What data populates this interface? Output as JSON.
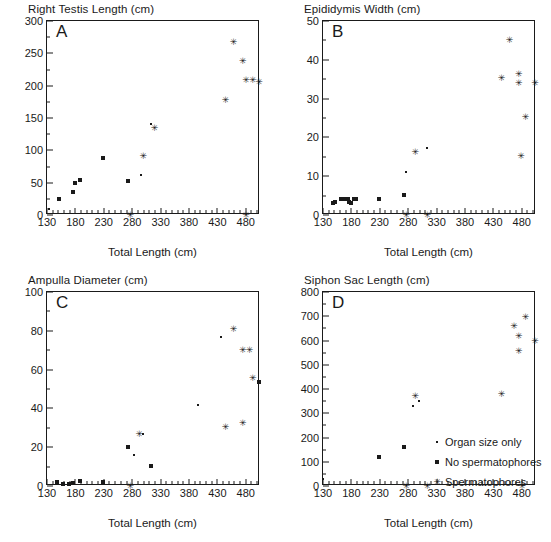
{
  "figure": {
    "xlabel": "Total Length (cm)",
    "xticks": [
      130,
      180,
      230,
      280,
      330,
      380,
      430,
      480
    ],
    "xlim": [
      130,
      505
    ],
    "legend": {
      "position": "panel-d-inside-right",
      "entries": [
        {
          "marker": "dot",
          "label": "Organ size only"
        },
        {
          "marker": "square",
          "label": "No spermatophores"
        },
        {
          "marker": "star",
          "label": "Spermatophores"
        }
      ]
    }
  },
  "chart_data": [
    {
      "type": "scatter",
      "panel": "A",
      "title": "Right Testis Length (cm)",
      "xlabel": "Total Length (cm)",
      "ylabel": "Right Testis Length (cm)",
      "xlim": [
        130,
        505
      ],
      "ylim": [
        0,
        300
      ],
      "yticks": [
        0,
        50,
        100,
        150,
        200,
        250,
        300
      ],
      "grid": false,
      "series": [
        {
          "name": "Organ size only",
          "marker": "dot",
          "points": [
            [
              133,
              10
            ],
            [
              313,
              140
            ],
            [
              296,
              62
            ]
          ]
        },
        {
          "name": "No spermatophores",
          "marker": "square",
          "points": [
            [
              152,
              25
            ],
            [
              176,
              35
            ],
            [
              179,
              49
            ],
            [
              188,
              54
            ],
            [
              229,
              88
            ],
            [
              272,
              53
            ]
          ]
        },
        {
          "name": "Spermatophores",
          "marker": "star",
          "points": [
            [
              276,
              0
            ],
            [
              319,
              135
            ],
            [
              299,
              92
            ],
            [
              444,
              178
            ],
            [
              458,
              267
            ],
            [
              474,
              238
            ],
            [
              480,
              208
            ],
            [
              480,
              0
            ],
            [
              492,
              208
            ],
            [
              503,
              205
            ]
          ]
        }
      ]
    },
    {
      "type": "scatter",
      "panel": "B",
      "title": "Epididymis Width (cm)",
      "xlabel": "Total Length (cm)",
      "ylabel": "Epididymis Width (cm)",
      "xlim": [
        130,
        505
      ],
      "ylim": [
        0,
        50
      ],
      "yticks": [
        0,
        10,
        20,
        30,
        40,
        50
      ],
      "grid": false,
      "series": [
        {
          "name": "Organ size only",
          "marker": "dot",
          "points": [
            [
              276,
              11.2
            ],
            [
              313,
              17.2
            ]
          ]
        },
        {
          "name": "No spermatophores",
          "marker": "square",
          "points": [
            [
              148,
              3.2
            ],
            [
              152,
              3.3
            ],
            [
              161,
              4.0
            ],
            [
              168,
              4.0
            ],
            [
              174,
              4.0
            ],
            [
              176,
              3.3
            ],
            [
              180,
              3.2
            ],
            [
              184,
              4.0
            ],
            [
              188,
              4.0
            ],
            [
              229,
              4.1
            ],
            [
              272,
              5.1
            ]
          ]
        },
        {
          "name": "Spermatophores",
          "marker": "star",
          "points": [
            [
              276,
              0
            ],
            [
              292,
              16.2
            ],
            [
              313,
              0
            ],
            [
              444,
              35.3
            ],
            [
              458,
              45.2
            ],
            [
              474,
              36.3
            ],
            [
              474,
              34.1
            ],
            [
              478,
              15.2
            ],
            [
              486,
              25.2
            ],
            [
              503,
              34.0
            ]
          ]
        }
      ]
    },
    {
      "type": "scatter",
      "panel": "C",
      "title": "Ampulla Diameter (cm)",
      "xlabel": "Total Length (cm)",
      "ylabel": "Ampulla Diameter (cm)",
      "xlim": [
        130,
        505
      ],
      "ylim": [
        0,
        100
      ],
      "yticks": [
        0,
        20,
        40,
        60,
        80,
        100
      ],
      "grid": false,
      "series": [
        {
          "name": "Organ size only",
          "marker": "dot",
          "points": [
            [
              283,
              16
            ],
            [
              299,
              27
            ],
            [
              396,
              42
            ],
            [
              436,
              77
            ]
          ]
        },
        {
          "name": "No spermatophores",
          "marker": "square",
          "points": [
            [
              148,
              2.0
            ],
            [
              159,
              1.2
            ],
            [
              168,
              1.2
            ],
            [
              176,
              1.8
            ],
            [
              188,
              2.4
            ],
            [
              229,
              2.0
            ],
            [
              272,
              20
            ],
            [
              313,
              10.3
            ],
            [
              503,
              53.5
            ]
          ]
        },
        {
          "name": "Spermatophores",
          "marker": "star",
          "points": [
            [
              276,
              0
            ],
            [
              292,
              27
            ],
            [
              444,
              30.5
            ],
            [
              458,
              81
            ],
            [
              474,
              32.3
            ],
            [
              474,
              70
            ],
            [
              486,
              70
            ],
            [
              492,
              55.5
            ]
          ]
        }
      ]
    },
    {
      "type": "scatter",
      "panel": "D",
      "title": "Siphon Sac Length (cm)",
      "xlabel": "Total Length (cm)",
      "ylabel": "Siphon Sac Length (cm)",
      "xlim": [
        130,
        505
      ],
      "ylim": [
        0,
        800
      ],
      "yticks": [
        0,
        100,
        200,
        300,
        400,
        500,
        600,
        700,
        800
      ],
      "grid": false,
      "series": [
        {
          "name": "Organ size only",
          "marker": "dot",
          "points": [
            [
              130,
              30
            ],
            [
              288,
              330
            ],
            [
              299,
              350
            ]
          ]
        },
        {
          "name": "No spermatophores",
          "marker": "square",
          "points": [
            [
              229,
              118
            ],
            [
              272,
              160
            ]
          ]
        },
        {
          "name": "Spermatophores",
          "marker": "star",
          "points": [
            [
              276,
              0
            ],
            [
              292,
              370
            ],
            [
              313,
              0
            ],
            [
              444,
              380
            ],
            [
              466,
              658
            ],
            [
              474,
              618
            ],
            [
              474,
              558
            ],
            [
              480,
              0
            ],
            [
              486,
              698
            ],
            [
              503,
              598
            ]
          ]
        }
      ]
    }
  ]
}
